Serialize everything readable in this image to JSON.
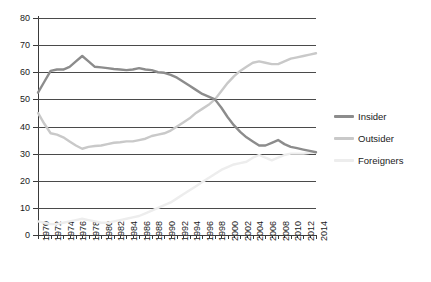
{
  "chart_data": {
    "type": "line",
    "title": "",
    "subtitle": "",
    "xlabel": "",
    "ylabel": "",
    "xlim": [
      1970,
      2014
    ],
    "ylim": [
      0,
      80
    ],
    "grid": true,
    "legend_position": "right",
    "y_ticks": [
      0,
      10,
      20,
      30,
      40,
      50,
      60,
      70,
      80
    ],
    "x_ticks": [
      1970,
      1972,
      1974,
      1976,
      1978,
      1980,
      1982,
      1984,
      1986,
      1988,
      1990,
      1992,
      1994,
      1996,
      1998,
      2000,
      2002,
      2004,
      2006,
      2008,
      2010,
      2012,
      2014
    ],
    "x_tick_labels": [
      "1970",
      "1972",
      "1974",
      "1976",
      "1978",
      "1980",
      "1982",
      "1984",
      "1986",
      "1988",
      "1990",
      "1992",
      "1994",
      "1996",
      "1998",
      "2000",
      "2002",
      "2004",
      "2006",
      "2008",
      "2010",
      "2012",
      "2014"
    ],
    "x": [
      1970,
      1971,
      1972,
      1973,
      1974,
      1975,
      1976,
      1977,
      1978,
      1979,
      1980,
      1981,
      1982,
      1983,
      1984,
      1985,
      1986,
      1987,
      1988,
      1989,
      1990,
      1991,
      1992,
      1993,
      1994,
      1995,
      1996,
      1997,
      1998,
      1999,
      2000,
      2001,
      2002,
      2003,
      2004,
      2005,
      2006,
      2007,
      2008,
      2009,
      2010,
      2011,
      2012,
      2013,
      2014
    ],
    "series": [
      {
        "name": "Insider",
        "color": "#8c8c8c",
        "values": [
          52.5,
          56.5,
          60.5,
          61.0,
          61.0,
          62.0,
          64.0,
          66.0,
          64.0,
          62.0,
          61.8,
          61.5,
          61.2,
          61.0,
          60.8,
          61.0,
          61.5,
          61.0,
          60.8,
          60.0,
          59.8,
          59.0,
          58.0,
          56.5,
          55.0,
          53.5,
          52.0,
          51.0,
          50.0,
          47.0,
          43.5,
          40.5,
          38.0,
          36.0,
          34.5,
          33.0,
          33.0,
          34.0,
          35.0,
          33.5,
          32.5,
          32.0,
          31.5,
          31.0,
          30.5
        ]
      },
      {
        "name": "Outsider",
        "color": "#c9c9c9",
        "values": [
          45.0,
          41.0,
          37.5,
          37.0,
          36.0,
          34.5,
          33.0,
          31.8,
          32.5,
          32.8,
          33.0,
          33.5,
          34.0,
          34.2,
          34.5,
          34.5,
          35.0,
          35.5,
          36.5,
          37.0,
          37.5,
          38.5,
          40.0,
          41.5,
          43.0,
          45.0,
          46.5,
          48.0,
          50.0,
          53.0,
          56.0,
          58.5,
          60.5,
          62.0,
          63.5,
          64.0,
          63.5,
          63.0,
          63.0,
          64.0,
          65.0,
          65.5,
          66.0,
          66.5,
          67.0
        ]
      },
      {
        "name": "Foreigners",
        "color": "#ededed",
        "values": [
          5.0,
          4.5,
          4.0,
          4.0,
          4.5,
          5.0,
          5.5,
          6.0,
          5.5,
          5.0,
          4.5,
          4.5,
          5.0,
          5.5,
          6.0,
          6.5,
          7.0,
          8.0,
          9.0,
          10.0,
          11.0,
          12.0,
          13.5,
          15.0,
          16.5,
          18.0,
          19.5,
          21.0,
          22.5,
          24.0,
          25.0,
          26.0,
          26.5,
          27.0,
          28.5,
          29.5,
          28.5,
          27.5,
          28.5,
          29.5,
          30.0,
          30.0,
          30.0,
          30.3,
          30.5
        ]
      }
    ],
    "legend": [
      {
        "label": "Insider",
        "color": "#8c8c8c"
      },
      {
        "label": "Outsider",
        "color": "#c9c9c9"
      },
      {
        "label": "Foreigners",
        "color": "#ededed"
      }
    ]
  }
}
